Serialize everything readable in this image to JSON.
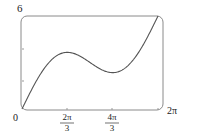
{
  "chart_data": {
    "type": "line",
    "title": "",
    "function": "f(x) = x + 2 sin x",
    "xlabel": "",
    "ylabel": "",
    "xlim": [
      0,
      6.2832
    ],
    "ylim": [
      0,
      6.2832
    ],
    "x_ticks": [
      {
        "value": 0,
        "label": "0"
      },
      {
        "value": 2.0944,
        "label_num": "2π",
        "label_den": "3"
      },
      {
        "value": 4.1888,
        "label_num": "4π",
        "label_den": "3"
      },
      {
        "value": 6.2832,
        "label": "2π"
      }
    ],
    "y_ticks": [
      {
        "value": 6,
        "label": "6"
      }
    ],
    "series": [
      {
        "name": "f(x)",
        "x": [
          0,
          0.5,
          1.0,
          1.5,
          2.0944,
          2.5,
          3.0,
          3.5,
          4.1888,
          4.5,
          5.0,
          5.5,
          6.2832
        ],
        "y": [
          0,
          1.46,
          2.68,
          3.49,
          3.83,
          3.7,
          3.28,
          2.8,
          2.46,
          2.55,
          3.08,
          4.09,
          6.28
        ]
      }
    ],
    "grid": false,
    "colors": {
      "curve": "#555555",
      "frame": "#888888"
    }
  },
  "labels": {
    "y_top": "6",
    "origin": "0",
    "x1_num": "2π",
    "x1_den": "3",
    "x2_num": "4π",
    "x2_den": "3",
    "x_end": "2π"
  }
}
